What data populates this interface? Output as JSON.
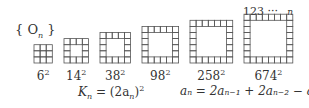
{
  "set_label": "{ O",
  "set_label_sub": "n",
  "set_label_close": " }",
  "top_index": {
    "digits": "123 ···",
    "n": "n"
  },
  "squares": [
    {
      "size": 3,
      "hollow": false,
      "label": "6",
      "exp": "2"
    },
    {
      "size": 4,
      "hollow": true,
      "label": "14",
      "exp": "2"
    },
    {
      "size": 5,
      "hollow": true,
      "label": "38",
      "exp": "2"
    },
    {
      "size": 6,
      "hollow": true,
      "label": "98",
      "exp": "2"
    },
    {
      "size": 7,
      "hollow": true,
      "label": "258",
      "exp": "2"
    },
    {
      "size": 8,
      "hollow": true,
      "label": "674",
      "exp": "2"
    }
  ],
  "formula_k": {
    "lhs": "K",
    "sub": "n",
    "rhs": " = (2a",
    "rhs_sub": "n",
    "close": ")",
    "exp": "2"
  },
  "formula_a": "aₙ = 2aₙ₋₁ + 2aₙ₋₂ − aₙ₋₃",
  "colors": {
    "line": "#555555",
    "text": "#333333"
  }
}
